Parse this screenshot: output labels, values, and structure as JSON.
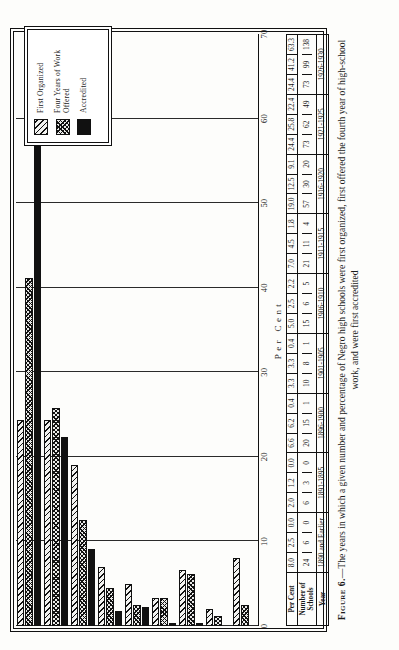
{
  "figure": {
    "number_label": "Figure 6.",
    "caption": "—The years in which a given number and percentage of Negro high schools were first organized, first offered the fourth year of high-school work, and were first accredited"
  },
  "axis": {
    "title": "Per Cent",
    "ticks": [
      "0",
      "10",
      "20",
      "30",
      "40",
      "50",
      "60",
      "70"
    ]
  },
  "legend": {
    "items": [
      {
        "label": "First Organized",
        "pattern": "diagonal-hatch"
      },
      {
        "label": "Four Years of Work Offered",
        "pattern": "checkered"
      },
      {
        "label": "Accredited",
        "pattern": "solid-black"
      }
    ]
  },
  "table": {
    "row_labels": [
      "Per Cent",
      "Number of Schools",
      "Year"
    ],
    "years": [
      "1890 and Earlier",
      "1891-1895",
      "1896-1900",
      "1901-1905",
      "1906-1910",
      "1911-1915",
      "1916-1920",
      "1921-1925",
      "1926-1930"
    ],
    "per_cent": [
      [
        "8.0",
        "2.5",
        "0.0"
      ],
      [
        "2.0",
        "1.2",
        "0.0"
      ],
      [
        "6.6",
        "6.2",
        "0.4"
      ],
      [
        "3.3",
        "3.3",
        "0.4"
      ],
      [
        "5.0",
        "2.5",
        "2.2"
      ],
      [
        "7.0",
        "4.5",
        "1.8"
      ],
      [
        "19.0",
        "12.5",
        "9.1"
      ],
      [
        "24.4",
        "25.8",
        "22.4"
      ],
      [
        "24.4",
        "41.2",
        "63.3"
      ]
    ],
    "number_of_schools": [
      [
        "24",
        "6",
        "0"
      ],
      [
        "6",
        "3",
        "0"
      ],
      [
        "20",
        "15",
        "1"
      ],
      [
        "10",
        "8",
        "1"
      ],
      [
        "15",
        "6",
        "5"
      ],
      [
        "21",
        "11",
        "4"
      ],
      [
        "57",
        "30",
        "20"
      ],
      [
        "73",
        "62",
        "49"
      ],
      [
        "73",
        "99",
        "138"
      ]
    ]
  },
  "chart_data": {
    "type": "bar",
    "orientation": "horizontal",
    "title": "The years in which a given number and percentage of Negro high schools were first organized, first offered the fourth year of high-school work, and were first accredited",
    "xlabel": "Per Cent",
    "ylabel": "Year",
    "xlim": [
      0,
      70
    ],
    "xticks": [
      0,
      10,
      20,
      30,
      40,
      50,
      60,
      70
    ],
    "grid": true,
    "legend_position": "upper-right",
    "categories": [
      "1890 and Earlier",
      "1891-1895",
      "1896-1900",
      "1901-1905",
      "1906-1910",
      "1911-1915",
      "1916-1920",
      "1921-1925",
      "1926-1930"
    ],
    "series": [
      {
        "name": "First Organized",
        "pattern": "diagonal-hatch",
        "values": [
          8.0,
          2.0,
          6.6,
          3.3,
          5.0,
          7.0,
          19.0,
          24.4,
          24.4
        ],
        "counts": [
          24,
          6,
          20,
          10,
          15,
          21,
          57,
          73,
          73
        ]
      },
      {
        "name": "Four Years of Work Offered",
        "pattern": "checkered",
        "values": [
          2.5,
          1.2,
          6.2,
          3.3,
          2.5,
          4.5,
          12.5,
          25.8,
          41.2
        ],
        "counts": [
          6,
          3,
          15,
          8,
          6,
          11,
          30,
          62,
          99
        ]
      },
      {
        "name": "Accredited",
        "pattern": "solid-black",
        "values": [
          0.0,
          0.0,
          0.4,
          0.4,
          2.2,
          1.8,
          9.1,
          22.4,
          63.3
        ],
        "counts": [
          0,
          0,
          1,
          1,
          5,
          4,
          20,
          49,
          138
        ]
      }
    ]
  }
}
